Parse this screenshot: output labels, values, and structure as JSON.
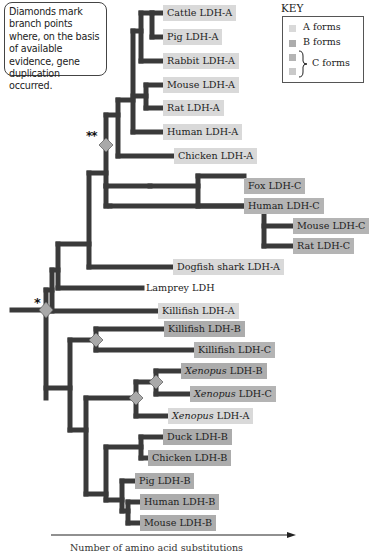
{
  "note": {
    "text": "Diamonds mark branch points where, on the basis of available evidence, gene duplication occurred."
  },
  "key": {
    "title": "KEY",
    "items": [
      {
        "label": "A forms",
        "color": "#d9d9d9"
      },
      {
        "label": "B forms",
        "color": "#acacac"
      },
      {
        "label": "C forms",
        "colors": [
          "#b4b4b4",
          "#c9c9c9"
        ]
      }
    ]
  },
  "markers": {
    "double_star": "**",
    "single_star": "*"
  },
  "leaves": [
    {
      "id": "cattle-ldh-a",
      "species": "Cattle",
      "gene": "LDH-A",
      "form": "A",
      "italic": false,
      "x": 163,
      "y": 5
    },
    {
      "id": "pig-ldh-a",
      "species": "Pig",
      "gene": "LDH-A",
      "form": "A",
      "italic": false,
      "x": 163,
      "y": 29
    },
    {
      "id": "rabbit-ldh-a",
      "species": "Rabbit",
      "gene": "LDH-A",
      "form": "A",
      "italic": false,
      "x": 163,
      "y": 53
    },
    {
      "id": "mouse-ldh-a",
      "species": "Mouse",
      "gene": "LDH-A",
      "form": "A",
      "italic": false,
      "x": 163,
      "y": 77
    },
    {
      "id": "rat-ldh-a",
      "species": "Rat",
      "gene": "LDH-A",
      "form": "A",
      "italic": false,
      "x": 163,
      "y": 100
    },
    {
      "id": "human-ldh-a",
      "species": "Human",
      "gene": "LDH-A",
      "form": "A",
      "italic": false,
      "x": 163,
      "y": 124
    },
    {
      "id": "chicken-ldh-a",
      "species": "Chicken",
      "gene": "LDH-A",
      "form": "A",
      "italic": false,
      "x": 174,
      "y": 148
    },
    {
      "id": "fox-ldh-c",
      "species": "Fox",
      "gene": "LDH-C",
      "form": "C",
      "italic": false,
      "x": 244,
      "y": 178
    },
    {
      "id": "human-ldh-c",
      "species": "Human",
      "gene": "LDH-C",
      "form": "C",
      "italic": false,
      "x": 244,
      "y": 198
    },
    {
      "id": "mouse-ldh-c",
      "species": "Mouse",
      "gene": "LDH-C",
      "form": "C",
      "italic": false,
      "x": 293,
      "y": 218
    },
    {
      "id": "rat-ldh-c",
      "species": "Rat",
      "gene": "LDH-C",
      "form": "C",
      "italic": false,
      "x": 293,
      "y": 238
    },
    {
      "id": "dogfish-shark-ldh-a",
      "species": "Dogfish shark",
      "gene": "LDH-A",
      "form": "A",
      "italic": false,
      "x": 173,
      "y": 259
    },
    {
      "id": "lamprey-ldh",
      "species": "Lamprey",
      "gene": "LDH",
      "form": "none",
      "italic": false,
      "x": 142,
      "y": 280
    },
    {
      "id": "killifish-ldh-a",
      "species": "Killifish",
      "gene": "LDH-A",
      "form": "A",
      "italic": false,
      "x": 158,
      "y": 303
    },
    {
      "id": "killifish-ldh-b",
      "species": "Killifish",
      "gene": "LDH-B",
      "form": "B",
      "italic": false,
      "x": 164,
      "y": 321
    },
    {
      "id": "killifish-ldh-c",
      "species": "Killifish",
      "gene": "LDH-C",
      "form": "C",
      "italic": false,
      "x": 194,
      "y": 342
    },
    {
      "id": "xenopus-ldh-b",
      "species": "Xenopus",
      "gene": "LDH-B",
      "form": "B",
      "italic": true,
      "x": 181,
      "y": 363
    },
    {
      "id": "xenopus-ldh-c",
      "species": "Xenopus",
      "gene": "LDH-C",
      "form": "C",
      "italic": true,
      "x": 190,
      "y": 386
    },
    {
      "id": "xenopus-ldh-a",
      "species": "Xenopus",
      "gene": "LDH-A",
      "form": "A",
      "italic": true,
      "x": 168,
      "y": 408
    },
    {
      "id": "duck-ldh-b",
      "species": "Duck",
      "gene": "LDH-B",
      "form": "B",
      "italic": false,
      "x": 163,
      "y": 429
    },
    {
      "id": "chicken-ldh-b",
      "species": "Chicken",
      "gene": "LDH-B",
      "form": "B",
      "italic": false,
      "x": 148,
      "y": 450
    },
    {
      "id": "pig-ldh-b",
      "species": "Pig",
      "gene": "LDH-B",
      "form": "B",
      "italic": false,
      "x": 135,
      "y": 473
    },
    {
      "id": "human-ldh-b",
      "species": "Human",
      "gene": "LDH-B",
      "form": "B",
      "italic": false,
      "x": 140,
      "y": 494
    },
    {
      "id": "mouse-ldh-b",
      "species": "Mouse",
      "gene": "LDH-B",
      "form": "B",
      "italic": false,
      "x": 140,
      "y": 515
    }
  ],
  "axis": {
    "label": "Number of amino acid substitutions"
  },
  "colors": {
    "branch": "#3a3a3a",
    "diamond_fill": "#a9a9a9",
    "diamond_stroke": "#555555"
  }
}
